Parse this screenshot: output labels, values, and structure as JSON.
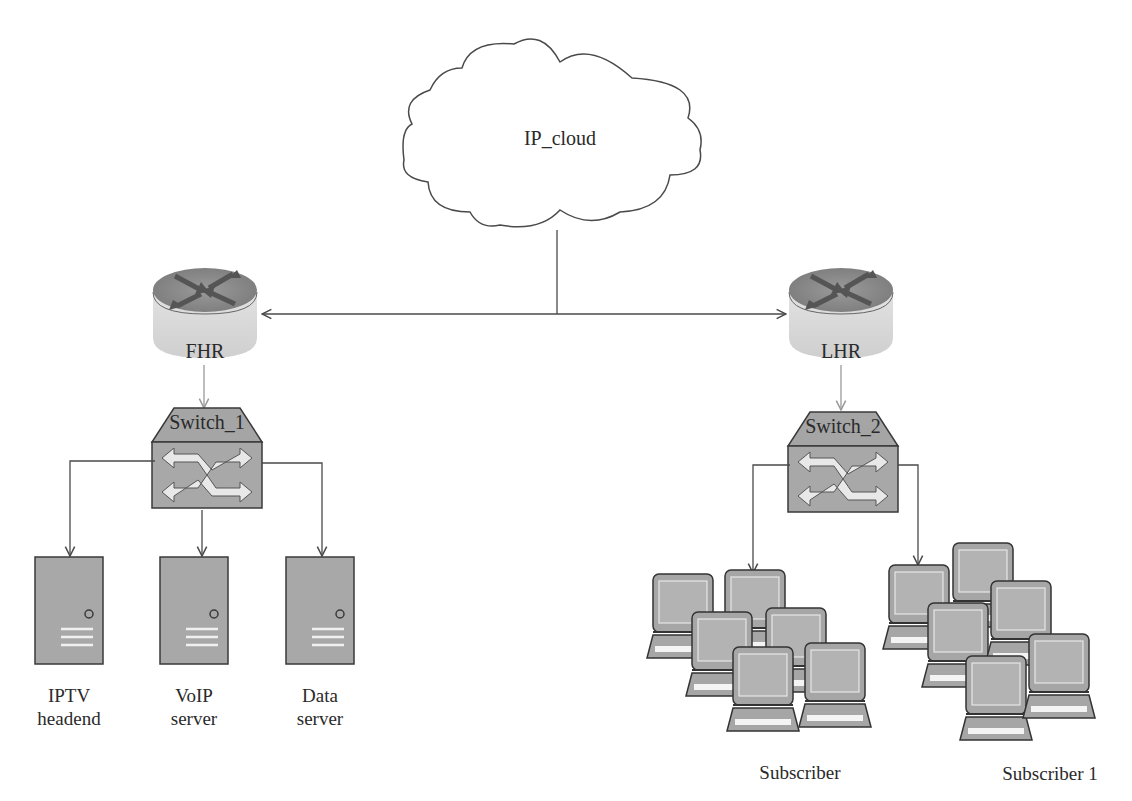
{
  "diagram": {
    "cloud": {
      "label": "IP_cloud"
    },
    "routers": [
      {
        "id": "fhr",
        "label": "FHR"
      },
      {
        "id": "lhr",
        "label": "LHR"
      }
    ],
    "switches": [
      {
        "id": "switch1",
        "label": "Switch_1"
      },
      {
        "id": "switch2",
        "label": "Switch_2"
      }
    ],
    "servers": [
      {
        "id": "iptv",
        "line1": "IPTV",
        "line2": "headend"
      },
      {
        "id": "voip",
        "line1": "VoIP",
        "line2": "server"
      },
      {
        "id": "data",
        "line1": "Data",
        "line2": "server"
      }
    ],
    "subscriber_groups": [
      {
        "id": "subscriber",
        "label": "Subscriber"
      },
      {
        "id": "subscriber1",
        "label": "Subscriber 1"
      }
    ],
    "colors": {
      "device_fill": "#a8a8a8",
      "device_stroke": "#3a3a3a",
      "router_top": "#8c8c8c",
      "router_side": "#d8d8d8",
      "line": "#4a4a4a",
      "light_line": "#9a9a9a"
    }
  }
}
